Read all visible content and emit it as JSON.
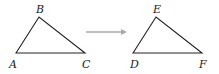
{
  "diagram": {
    "triangle_original": {
      "vertices": [
        {
          "label": "A",
          "x": 16,
          "y": 53
        },
        {
          "label": "B",
          "x": 39,
          "y": 17
        },
        {
          "label": "C",
          "x": 85,
          "y": 53
        }
      ]
    },
    "arrow": {
      "x1": 86,
      "y1": 32,
      "x2": 127,
      "y2": 32,
      "color": "#aaaaaa"
    },
    "triangle_image": {
      "vertices": [
        {
          "label": "D",
          "x": 133,
          "y": 53
        },
        {
          "label": "E",
          "x": 156,
          "y": 17
        },
        {
          "label": "F",
          "x": 202,
          "y": 53
        }
      ]
    },
    "labels": {
      "A": "A",
      "B": "B",
      "C": "C",
      "D": "D",
      "E": "E",
      "F": "F"
    },
    "stroke_color": "#222222"
  }
}
